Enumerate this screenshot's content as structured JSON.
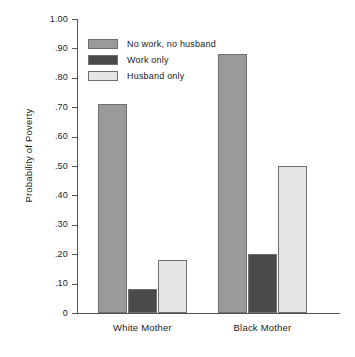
{
  "chart_data": {
    "type": "bar",
    "title": "",
    "subtitle": "",
    "xlabel": "",
    "ylabel": "Probability of Poverty",
    "categories": [
      "White Mother",
      "Black Mother"
    ],
    "series": [
      {
        "name": "No work, no husband",
        "color": "#9a9a9a",
        "values": [
          0.71,
          0.88
        ]
      },
      {
        "name": "Work only",
        "color": "#4a4a4a",
        "values": [
          0.08,
          0.2
        ]
      },
      {
        "name": "Husband only",
        "color": "#e6e6e6",
        "values": [
          0.18,
          0.5
        ]
      }
    ],
    "ylim": [
      0,
      1.0
    ],
    "ytick_values": [
      0,
      0.1,
      0.2,
      0.3,
      0.4,
      0.5,
      0.6,
      0.7,
      0.8,
      0.9,
      1.0
    ],
    "ytick_labels": [
      "0",
      ".10",
      ".20",
      ".30",
      ".40",
      ".50",
      ".60",
      ".70",
      ".80",
      ".90",
      "1.00"
    ],
    "grid": false,
    "legend_position": "top-left",
    "axis_color": "#555555",
    "bar_border_color": "#6f6f6f"
  }
}
